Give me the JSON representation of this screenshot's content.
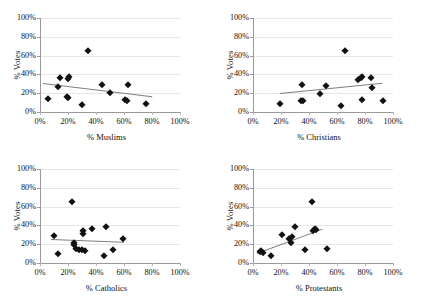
{
  "figure": {
    "layout": "2x2 grid of scatter plots",
    "background_color": "#ffffff",
    "marker_color": "#111111",
    "trendline_color": "#7f7f7f",
    "gridline_color": "#e6e6e6",
    "axis_color": "#9a9a9a"
  },
  "chart_data": [
    {
      "type": "scatter",
      "title": "",
      "xlabel": "% Muslims",
      "ylabel": "% Votes",
      "xlim": [
        0,
        100
      ],
      "ylim": [
        0,
        100
      ],
      "xticks": [
        "0%",
        "20%",
        "40%",
        "60%",
        "80%",
        "100%"
      ],
      "yticks": [
        "0%",
        "20%",
        "40%",
        "60%",
        "80%",
        "100%"
      ],
      "xtick_values": [
        0,
        20,
        40,
        60,
        80,
        100
      ],
      "ytick_values": [
        0,
        20,
        40,
        60,
        80,
        100
      ],
      "grid": "horizontal",
      "legend": "none",
      "points": [
        {
          "x": 6,
          "y": 14
        },
        {
          "x": 13,
          "y": 27
        },
        {
          "x": 14,
          "y": 36
        },
        {
          "x": 20,
          "y": 35
        },
        {
          "x": 21,
          "y": 37
        },
        {
          "x": 20,
          "y": 15
        },
        {
          "x": 19,
          "y": 16
        },
        {
          "x": 30,
          "y": 7
        },
        {
          "x": 34,
          "y": 65
        },
        {
          "x": 44,
          "y": 29
        },
        {
          "x": 50,
          "y": 20
        },
        {
          "x": 61,
          "y": 13
        },
        {
          "x": 62,
          "y": 12
        },
        {
          "x": 63,
          "y": 29
        },
        {
          "x": 76,
          "y": 9
        }
      ],
      "trendline": {
        "x0": 2,
        "y0": 31,
        "x1": 80,
        "y1": 17,
        "slope": "negative"
      }
    },
    {
      "type": "scatter",
      "title": "",
      "xlabel": "% Christians",
      "ylabel": "% Votes",
      "xlim": [
        0,
        100
      ],
      "ylim": [
        0,
        100
      ],
      "xticks": [
        "0%",
        "20%",
        "40%",
        "60%",
        "80%",
        "100%"
      ],
      "yticks": [
        "0%",
        "20%",
        "40%",
        "60%",
        "80%",
        "100%"
      ],
      "xtick_values": [
        0,
        20,
        40,
        60,
        80,
        100
      ],
      "ytick_values": [
        0,
        20,
        40,
        60,
        80,
        100
      ],
      "grid": "horizontal",
      "legend": "none",
      "points": [
        {
          "x": 19,
          "y": 9
        },
        {
          "x": 34,
          "y": 12
        },
        {
          "x": 36,
          "y": 12
        },
        {
          "x": 35,
          "y": 29
        },
        {
          "x": 48,
          "y": 19
        },
        {
          "x": 52,
          "y": 28
        },
        {
          "x": 63,
          "y": 6
        },
        {
          "x": 66,
          "y": 65
        },
        {
          "x": 75,
          "y": 34
        },
        {
          "x": 77,
          "y": 36
        },
        {
          "x": 78,
          "y": 37
        },
        {
          "x": 78,
          "y": 13
        },
        {
          "x": 84,
          "y": 36
        },
        {
          "x": 85,
          "y": 26
        },
        {
          "x": 93,
          "y": 12
        }
      ],
      "trendline": {
        "x0": 19,
        "y0": 20,
        "x1": 92,
        "y1": 31,
        "slope": "positive"
      }
    },
    {
      "type": "scatter",
      "title": "",
      "xlabel": "% Catholics",
      "ylabel": "% Votes",
      "xlim": [
        0,
        100
      ],
      "ylim": [
        0,
        100
      ],
      "xticks": [
        "0%",
        "20%",
        "40%",
        "60%",
        "80%",
        "100%"
      ],
      "yticks": [
        "0%",
        "20%",
        "40%",
        "60%",
        "80%",
        "100%"
      ],
      "xtick_values": [
        0,
        20,
        40,
        60,
        80,
        100
      ],
      "ytick_values": [
        0,
        20,
        40,
        60,
        80,
        100
      ],
      "grid": "horizontal",
      "legend": "none",
      "points": [
        {
          "x": 10,
          "y": 29
        },
        {
          "x": 13,
          "y": 10
        },
        {
          "x": 23,
          "y": 65
        },
        {
          "x": 24,
          "y": 21
        },
        {
          "x": 24,
          "y": 19
        },
        {
          "x": 26,
          "y": 15
        },
        {
          "x": 28,
          "y": 14
        },
        {
          "x": 30,
          "y": 14
        },
        {
          "x": 31,
          "y": 31
        },
        {
          "x": 31,
          "y": 34
        },
        {
          "x": 32,
          "y": 13
        },
        {
          "x": 37,
          "y": 36
        },
        {
          "x": 46,
          "y": 7
        },
        {
          "x": 47,
          "y": 38
        },
        {
          "x": 52,
          "y": 14
        },
        {
          "x": 59,
          "y": 26
        }
      ],
      "trendline": {
        "x0": 8,
        "y0": 26,
        "x1": 60,
        "y1": 23,
        "slope": "negative"
      }
    },
    {
      "type": "scatter",
      "title": "",
      "xlabel": "% Protestants",
      "ylabel": "% Votes",
      "xlim": [
        0,
        100
      ],
      "ylim": [
        0,
        100
      ],
      "xticks": [
        "0%",
        "20%",
        "40%",
        "60%",
        "80%",
        "100%"
      ],
      "yticks": [
        "0%",
        "20%",
        "40%",
        "60%",
        "80%",
        "100%"
      ],
      "xtick_values": [
        0,
        20,
        40,
        60,
        80,
        100
      ],
      "ytick_values": [
        0,
        20,
        40,
        60,
        80,
        100
      ],
      "grid": "horizontal",
      "legend": "none",
      "points": [
        {
          "x": 5,
          "y": 12
        },
        {
          "x": 6,
          "y": 13
        },
        {
          "x": 7,
          "y": 11
        },
        {
          "x": 13,
          "y": 7
        },
        {
          "x": 21,
          "y": 30
        },
        {
          "x": 26,
          "y": 26
        },
        {
          "x": 27,
          "y": 21
        },
        {
          "x": 28,
          "y": 28
        },
        {
          "x": 30,
          "y": 38
        },
        {
          "x": 37,
          "y": 14
        },
        {
          "x": 42,
          "y": 65
        },
        {
          "x": 43,
          "y": 34
        },
        {
          "x": 44,
          "y": 36
        },
        {
          "x": 45,
          "y": 35
        },
        {
          "x": 53,
          "y": 15
        }
      ],
      "trendline": {
        "x0": 3,
        "y0": 11,
        "x1": 50,
        "y1": 37,
        "slope": "positive"
      }
    }
  ]
}
